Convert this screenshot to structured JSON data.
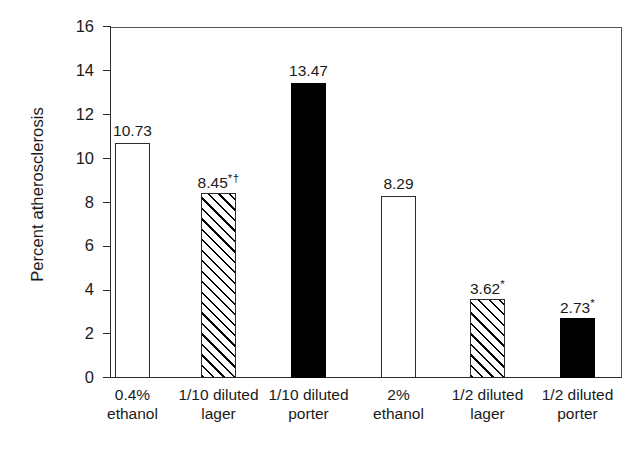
{
  "chart_data": {
    "type": "bar",
    "title": "",
    "xlabel": "",
    "ylabel": "Percent atherosclerosis",
    "ylim": [
      0,
      16
    ],
    "yticks": [
      0,
      2,
      4,
      6,
      8,
      10,
      12,
      14,
      16
    ],
    "grid": false,
    "legend": "none",
    "categories": [
      "0.4% ethanol",
      "1/10 diluted lager",
      "1/10 diluted porter",
      "2% ethanol",
      "1/2 diluted lager",
      "1/2 diluted porter"
    ],
    "category_lines": [
      {
        "line1": "0.4%",
        "line2": "ethanol"
      },
      {
        "line1": "1/10 diluted",
        "line2": "lager"
      },
      {
        "line1": "1/10 diluted",
        "line2": "porter"
      },
      {
        "line1": "2%",
        "line2": "ethanol"
      },
      {
        "line1": "1/2 diluted",
        "line2": "lager"
      },
      {
        "line1": "1/2 diluted",
        "line2": "porter"
      }
    ],
    "values": [
      10.73,
      8.45,
      13.47,
      8.29,
      3.62,
      2.73
    ],
    "value_labels": [
      "10.73",
      "8.45",
      "13.47",
      "8.29",
      "3.62",
      "2.73"
    ],
    "significance_marks": [
      "",
      "*†",
      "",
      "",
      "*",
      "*"
    ],
    "bar_styles": [
      "open",
      "hatched",
      "solid",
      "open",
      "hatched",
      "solid"
    ],
    "annotations": [
      "* denotes significance marker on 8.45, 3.62 and 2.73",
      "† denotes second significance marker on 8.45"
    ],
    "colors": {
      "open_fill": "#ffffff",
      "solid_fill": "#000000",
      "hatch_stroke": "#000000",
      "axis": "#2b2b2b",
      "text": "#1a1a1a",
      "background": "#ffffff"
    }
  },
  "ticks": [
    {
      "label": "16",
      "value": 16
    },
    {
      "label": "14",
      "value": 14
    },
    {
      "label": "12",
      "value": 12
    },
    {
      "label": "10",
      "value": 10
    },
    {
      "label": "8",
      "value": 8
    },
    {
      "label": "6",
      "value": 6
    },
    {
      "label": "4",
      "value": 4
    },
    {
      "label": "2",
      "value": 2
    },
    {
      "label": "0",
      "value": 0
    }
  ]
}
